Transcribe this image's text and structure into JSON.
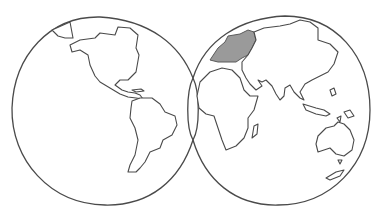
{
  "title": {
    "text": "",
    "clipped": true
  },
  "map": {
    "type": "double-hemisphere outline world map",
    "style": "hand-drawn pencil sketch",
    "hemispheres": [
      {
        "name": "western-hemisphere",
        "continents": [
          "North America",
          "Central America",
          "South America",
          "Greenland"
        ]
      },
      {
        "name": "eastern-hemisphere",
        "continents": [
          "Europe",
          "Africa",
          "Asia",
          "Australia",
          "Indonesia",
          "Madagascar",
          "Japan",
          "New Zealand"
        ]
      }
    ],
    "highlighted_region": {
      "name": "Europe",
      "color": "#9a9a9a"
    },
    "line_color": "#4a4a4a",
    "background": "#ffffff"
  }
}
